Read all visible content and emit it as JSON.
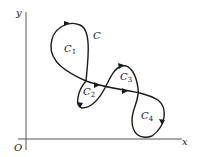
{
  "diagram": {
    "title": "",
    "axes": {
      "x_label": "x",
      "y_label": "y",
      "origin_label": "O"
    },
    "curve": {
      "label": "C",
      "regions": [
        {
          "name": "C",
          "sub": "1"
        },
        {
          "name": "C",
          "sub": "2"
        },
        {
          "name": "C",
          "sub": "3"
        },
        {
          "name": "C",
          "sub": "4"
        }
      ]
    },
    "colors": {
      "stroke": "#1a1a1a",
      "axis": "#555555",
      "background": "#ffffff"
    }
  }
}
